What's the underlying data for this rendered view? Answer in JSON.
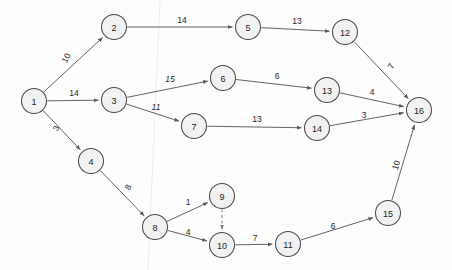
{
  "diagram": {
    "kind": "directed-network-graph",
    "title": "",
    "canvas": {
      "width": 452,
      "height": 270
    },
    "node_radius": 12.5,
    "colors": {
      "node_fill": "#f2f2f2",
      "node_stroke": "#4a4a4a",
      "edge_stroke": "#5a5a5a",
      "label_text": "#242424",
      "background": "#fdfdfd"
    },
    "nodes": [
      {
        "id": "n1",
        "label": "1",
        "x": 34,
        "y": 101
      },
      {
        "id": "n2",
        "label": "2",
        "x": 114,
        "y": 27
      },
      {
        "id": "n3",
        "label": "3",
        "x": 114,
        "y": 100
      },
      {
        "id": "n4",
        "label": "4",
        "x": 91,
        "y": 161
      },
      {
        "id": "n5",
        "label": "5",
        "x": 248,
        "y": 27
      },
      {
        "id": "n6",
        "label": "6",
        "x": 223,
        "y": 78
      },
      {
        "id": "n7",
        "label": "7",
        "x": 194,
        "y": 126
      },
      {
        "id": "n8",
        "label": "8",
        "x": 155,
        "y": 227
      },
      {
        "id": "n9",
        "label": "9",
        "x": 222,
        "y": 196
      },
      {
        "id": "n10",
        "label": "10",
        "x": 222,
        "y": 245
      },
      {
        "id": "n11",
        "label": "11",
        "x": 288,
        "y": 244
      },
      {
        "id": "n12",
        "label": "12",
        "x": 345,
        "y": 32
      },
      {
        "id": "n13",
        "label": "13",
        "x": 327,
        "y": 90
      },
      {
        "id": "n14",
        "label": "14",
        "x": 317,
        "y": 128
      },
      {
        "id": "n15",
        "label": "15",
        "x": 388,
        "y": 213
      },
      {
        "id": "n16",
        "label": "16",
        "x": 419,
        "y": 110
      }
    ],
    "edges": [
      {
        "id": "e1",
        "from": "n1",
        "to": "n2",
        "weight": "10",
        "lx": 66,
        "ly": 58,
        "rot": -63,
        "dashed": false,
        "italic": false
      },
      {
        "id": "e2",
        "from": "n1",
        "to": "n3",
        "weight": "14",
        "lx": 74,
        "ly": 93,
        "rot": 0,
        "dashed": false,
        "italic": false
      },
      {
        "id": "e3",
        "from": "n1",
        "to": "n4",
        "weight": "3",
        "lx": 56,
        "ly": 128,
        "rot": -66,
        "dashed": false,
        "italic": false
      },
      {
        "id": "e4",
        "from": "n2",
        "to": "n5",
        "weight": "14",
        "lx": 182,
        "ly": 20,
        "rot": 0,
        "dashed": false,
        "italic": false
      },
      {
        "id": "e5",
        "from": "n3",
        "to": "n6",
        "weight": "15",
        "lx": 170,
        "ly": 79,
        "rot": 0,
        "dashed": false,
        "italic": true
      },
      {
        "id": "e6",
        "from": "n3",
        "to": "n7",
        "weight": "11",
        "lx": 156,
        "ly": 107,
        "rot": 0,
        "dashed": false,
        "italic": true
      },
      {
        "id": "e7",
        "from": "n4",
        "to": "n8",
        "weight": "8",
        "lx": 128,
        "ly": 187,
        "rot": -66,
        "dashed": false,
        "italic": false
      },
      {
        "id": "e8",
        "from": "n5",
        "to": "n12",
        "weight": "13",
        "lx": 297,
        "ly": 21,
        "rot": 0,
        "dashed": false,
        "italic": false
      },
      {
        "id": "e9",
        "from": "n6",
        "to": "n13",
        "weight": "6",
        "lx": 277,
        "ly": 76,
        "rot": 0,
        "dashed": false,
        "italic": false
      },
      {
        "id": "e10",
        "from": "n7",
        "to": "n14",
        "weight": "13",
        "lx": 257,
        "ly": 119,
        "rot": 0,
        "dashed": false,
        "italic": false
      },
      {
        "id": "e11",
        "from": "n8",
        "to": "n9",
        "weight": "1",
        "lx": 188,
        "ly": 202,
        "rot": 0,
        "dashed": false,
        "italic": false
      },
      {
        "id": "e12",
        "from": "n8",
        "to": "n10",
        "weight": "4",
        "lx": 188,
        "ly": 232,
        "rot": 0,
        "dashed": false,
        "italic": false
      },
      {
        "id": "e13",
        "from": "n9",
        "to": "n10",
        "weight": "",
        "lx": 222,
        "ly": 221,
        "rot": 0,
        "dashed": true,
        "italic": false
      },
      {
        "id": "e14",
        "from": "n10",
        "to": "n11",
        "weight": "7",
        "lx": 255,
        "ly": 238,
        "rot": 0,
        "dashed": false,
        "italic": false
      },
      {
        "id": "e15",
        "from": "n11",
        "to": "n15",
        "weight": "6",
        "lx": 333,
        "ly": 226,
        "rot": 0,
        "dashed": false,
        "italic": false
      },
      {
        "id": "e16",
        "from": "n12",
        "to": "n16",
        "weight": "7",
        "lx": 391,
        "ly": 66,
        "rot": -62,
        "dashed": false,
        "italic": false
      },
      {
        "id": "e17",
        "from": "n13",
        "to": "n16",
        "weight": "4",
        "lx": 372,
        "ly": 92,
        "rot": 0,
        "dashed": false,
        "italic": false
      },
      {
        "id": "e18",
        "from": "n14",
        "to": "n16",
        "weight": "3",
        "lx": 364,
        "ly": 115,
        "rot": 0,
        "dashed": false,
        "italic": false
      },
      {
        "id": "e19",
        "from": "n15",
        "to": "n16",
        "weight": "10",
        "lx": 396,
        "ly": 165,
        "rot": -72,
        "dashed": false,
        "italic": false
      }
    ]
  }
}
